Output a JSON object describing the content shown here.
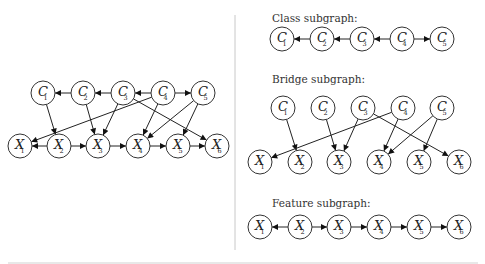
{
  "figure": {
    "left_graph": {
      "name": "full-graph",
      "node_radius": 12,
      "nodes": [
        {
          "id": "C1",
          "base": "C",
          "sub": "1",
          "x": 43,
          "y": 93
        },
        {
          "id": "C2",
          "base": "C",
          "sub": "2",
          "x": 83,
          "y": 93
        },
        {
          "id": "C3",
          "base": "C",
          "sub": "3",
          "x": 123,
          "y": 93
        },
        {
          "id": "C4",
          "base": "C",
          "sub": "4",
          "x": 163,
          "y": 93
        },
        {
          "id": "C5",
          "base": "C",
          "sub": "5",
          "x": 203,
          "y": 93
        },
        {
          "id": "X1",
          "base": "X",
          "sub": "1",
          "x": 20,
          "y": 146
        },
        {
          "id": "X2",
          "base": "X",
          "sub": "2",
          "x": 59,
          "y": 146
        },
        {
          "id": "X3",
          "base": "X",
          "sub": "3",
          "x": 98,
          "y": 146
        },
        {
          "id": "X4",
          "base": "X",
          "sub": "4",
          "x": 138,
          "y": 146
        },
        {
          "id": "X5",
          "base": "X",
          "sub": "5",
          "x": 178,
          "y": 146
        },
        {
          "id": "X6",
          "base": "X",
          "sub": "6",
          "x": 217,
          "y": 146
        }
      ],
      "edges": [
        [
          "C2",
          "C1"
        ],
        [
          "C3",
          "C2"
        ],
        [
          "C4",
          "C3"
        ],
        [
          "C4",
          "C5"
        ],
        [
          "X2",
          "X1"
        ],
        [
          "X2",
          "X3"
        ],
        [
          "X3",
          "X4"
        ],
        [
          "X4",
          "X5"
        ],
        [
          "X5",
          "X6"
        ],
        [
          "C1",
          "X2"
        ],
        [
          "C2",
          "X3"
        ],
        [
          "C3",
          "X3"
        ],
        [
          "C3",
          "X6"
        ],
        [
          "C4",
          "X1"
        ],
        [
          "C4",
          "X4"
        ],
        [
          "C5",
          "X4"
        ],
        [
          "C5",
          "X5"
        ]
      ]
    },
    "class_subgraph": {
      "title": "Class subgraph:",
      "title_x": 272,
      "title_y": 22,
      "node_radius": 12,
      "nodes": [
        {
          "id": "C1",
          "base": "C",
          "sub": "1",
          "x": 282,
          "y": 39
        },
        {
          "id": "C2",
          "base": "C",
          "sub": "2",
          "x": 322,
          "y": 39
        },
        {
          "id": "C3",
          "base": "C",
          "sub": "3",
          "x": 362,
          "y": 39
        },
        {
          "id": "C4",
          "base": "C",
          "sub": "4",
          "x": 402,
          "y": 39
        },
        {
          "id": "C5",
          "base": "C",
          "sub": "5",
          "x": 442,
          "y": 39
        }
      ],
      "edges": [
        [
          "C2",
          "C1"
        ],
        [
          "C3",
          "C2"
        ],
        [
          "C4",
          "C3"
        ],
        [
          "C4",
          "C5"
        ]
      ]
    },
    "bridge_subgraph": {
      "title": "Bridge subgraph:",
      "title_x": 272,
      "title_y": 83,
      "node_radius": 12,
      "nodes": [
        {
          "id": "C1",
          "base": "C",
          "sub": "1",
          "x": 283,
          "y": 108
        },
        {
          "id": "C2",
          "base": "C",
          "sub": "2",
          "x": 323,
          "y": 108
        },
        {
          "id": "C3",
          "base": "C",
          "sub": "3",
          "x": 363,
          "y": 108
        },
        {
          "id": "C4",
          "base": "C",
          "sub": "4",
          "x": 403,
          "y": 108
        },
        {
          "id": "C5",
          "base": "C",
          "sub": "5",
          "x": 442,
          "y": 108
        },
        {
          "id": "X1",
          "base": "X",
          "sub": "1",
          "x": 260,
          "y": 162
        },
        {
          "id": "X2",
          "base": "X",
          "sub": "2",
          "x": 300,
          "y": 162
        },
        {
          "id": "X3",
          "base": "X",
          "sub": "3",
          "x": 339,
          "y": 162
        },
        {
          "id": "X4",
          "base": "X",
          "sub": "4",
          "x": 379,
          "y": 162
        },
        {
          "id": "X5",
          "base": "X",
          "sub": "5",
          "x": 419,
          "y": 162
        },
        {
          "id": "X6",
          "base": "X",
          "sub": "6",
          "x": 459,
          "y": 162
        }
      ],
      "edges": [
        [
          "C1",
          "X2"
        ],
        [
          "C2",
          "X3"
        ],
        [
          "C3",
          "X3"
        ],
        [
          "C3",
          "X6"
        ],
        [
          "C4",
          "X1"
        ],
        [
          "C4",
          "X4"
        ],
        [
          "C5",
          "X4"
        ],
        [
          "C5",
          "X5"
        ]
      ]
    },
    "feature_subgraph": {
      "title": "Feature subgraph:",
      "title_x": 272,
      "title_y": 207,
      "node_radius": 12,
      "nodes": [
        {
          "id": "X1",
          "base": "X",
          "sub": "1",
          "x": 260,
          "y": 227
        },
        {
          "id": "X2",
          "base": "X",
          "sub": "2",
          "x": 300,
          "y": 227
        },
        {
          "id": "X3",
          "base": "X",
          "sub": "3",
          "x": 339,
          "y": 227
        },
        {
          "id": "X4",
          "base": "X",
          "sub": "4",
          "x": 379,
          "y": 227
        },
        {
          "id": "X5",
          "base": "X",
          "sub": "5",
          "x": 419,
          "y": 227
        },
        {
          "id": "X6",
          "base": "X",
          "sub": "6",
          "x": 459,
          "y": 227
        }
      ],
      "edges": [
        [
          "X2",
          "X1"
        ],
        [
          "X2",
          "X3"
        ],
        [
          "X3",
          "X4"
        ],
        [
          "X4",
          "X5"
        ],
        [
          "X5",
          "X6"
        ]
      ]
    },
    "divider": {
      "x": 235,
      "y1": 15,
      "y2": 250
    }
  }
}
